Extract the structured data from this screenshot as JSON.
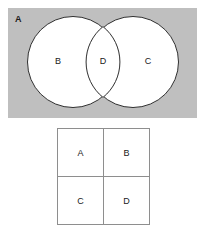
{
  "figure": {
    "venn": {
      "universe_label": "A",
      "left_circle_label": "B",
      "right_circle_label": "C",
      "intersection_label": "D",
      "background_color": "#bfbfbf",
      "circle_fill_color": "#ffffff",
      "circle_stroke_color": "#2f2f2f"
    },
    "table": {
      "border_color": "#8e8e8e",
      "cell_background": "#ffffff",
      "rows": [
        [
          "A",
          "B"
        ],
        [
          "C",
          "D"
        ]
      ]
    }
  }
}
